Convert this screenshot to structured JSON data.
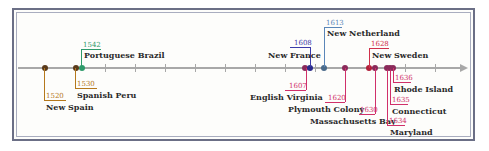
{
  "colors": {
    "spain": "#b5781c",
    "portugal": "#2e9a6a",
    "france": "#3a3aa8",
    "netherlands": "#5a86b8",
    "england": "#d0306a",
    "sweden": "#d0304a",
    "axis": "#a8a8a8",
    "frame": "#6b6f86"
  },
  "events": [
    {
      "year": "1520",
      "label": "New Spain",
      "color": "spain"
    },
    {
      "year": "1530",
      "label": "Spanish Peru",
      "color": "spain"
    },
    {
      "year": "1542",
      "label": "Portuguese Brazil",
      "color": "portugal"
    },
    {
      "year": "1607",
      "label": "English Virginia",
      "color": "england"
    },
    {
      "year": "1608",
      "label": "New France",
      "color": "france"
    },
    {
      "year": "1613",
      "label": "New Netherland",
      "color": "netherlands"
    },
    {
      "year": "1620",
      "label": "Plymouth Colony",
      "color": "england"
    },
    {
      "year": "1628",
      "label": "New Sweden",
      "color": "sweden"
    },
    {
      "year": "1630",
      "label": "Massachusetts Bay",
      "color": "england"
    },
    {
      "year": "1634",
      "label": "Maryland",
      "color": "england"
    },
    {
      "year": "1635",
      "label": "Connecticut",
      "color": "england"
    },
    {
      "year": "1636",
      "label": "Rhode Island",
      "color": "england"
    }
  ]
}
